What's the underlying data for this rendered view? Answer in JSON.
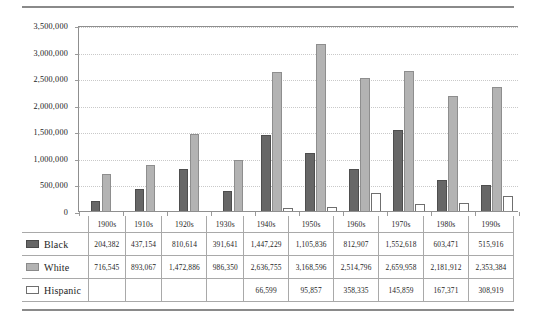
{
  "chart_data": {
    "type": "bar",
    "title": "",
    "subtitle": "",
    "xlabel": "",
    "ylabel": "",
    "ylim": [
      0,
      3500000
    ],
    "grid": true,
    "legend_position": "table-left",
    "categories": [
      "1900s",
      "1910s",
      "1920s",
      "1930s",
      "1940s",
      "1950s",
      "1960s",
      "1970s",
      "1980s",
      "1990s"
    ],
    "y_ticks": [
      0,
      500000,
      1000000,
      1500000,
      2000000,
      2500000,
      3000000,
      3500000
    ],
    "y_tick_labels": [
      "0",
      "500,000",
      "1,000,000",
      "1,500,000",
      "2,000,000",
      "2,500,000",
      "3,000,000",
      "3,500,000"
    ],
    "series": [
      {
        "name": "Black",
        "color": "#676767",
        "values": [
          204382,
          437154,
          810614,
          391641,
          1447229,
          1105836,
          812907,
          1552618,
          603471,
          515916
        ],
        "labels": [
          "204,382",
          "437,154",
          "810,614",
          "391,641",
          "1,447,229",
          "1,105,836",
          "812,907",
          "1,552,618",
          "603,471",
          "515,916"
        ]
      },
      {
        "name": "White",
        "color": "#b3b3b3",
        "values": [
          716545,
          893067,
          1472886,
          986350,
          2636755,
          3168596,
          2514796,
          2659958,
          2181912,
          2353384
        ],
        "labels": [
          "716,545",
          "893,067",
          "1,472,886",
          "986,350",
          "2,636,755",
          "3,168,596",
          "2,514,796",
          "2,659,958",
          "2,181,912",
          "2,353,384"
        ]
      },
      {
        "name": "Hispanic",
        "color": "#ffffff",
        "values": [
          null,
          null,
          null,
          null,
          66599,
          95857,
          358335,
          145859,
          167371,
          308919
        ],
        "labels": [
          "",
          "",
          "",
          "",
          "66,599",
          "95,857",
          "358,335",
          "145,859",
          "167,371",
          "308,919"
        ]
      }
    ]
  },
  "table": {
    "header_blank": "",
    "columns": [
      "1900s",
      "1910s",
      "1920s",
      "1930s",
      "1940s",
      "1950s",
      "1960s",
      "1970s",
      "1980s",
      "1990s"
    ],
    "rows": [
      {
        "label": "Black",
        "swatch": "black-swatch",
        "cells": [
          "204,382",
          "437,154",
          "810,614",
          "391,641",
          "1,447,229",
          "1,105,836",
          "812,907",
          "1,552,618",
          "603,471",
          "515,916"
        ]
      },
      {
        "label": "White",
        "swatch": "white-swatch",
        "cells": [
          "716,545",
          "893,067",
          "1,472,886",
          "986,350",
          "2,636,755",
          "3,168,596",
          "2,514,796",
          "2,659,958",
          "2,181,912",
          "2,353,384"
        ]
      },
      {
        "label": "Hispanic",
        "swatch": "hispanic-swatch",
        "cells": [
          "",
          "",
          "",
          "",
          "66,599",
          "95,857",
          "358,335",
          "145,859",
          "167,371",
          "308,919"
        ]
      }
    ]
  },
  "colors": {
    "black_series": "#676767",
    "white_series": "#b3b3b3",
    "hispanic_series": "#ffffff",
    "axis": "#8f8f8f",
    "grid": "#c9c9c9",
    "rule": "#8a8a8a"
  }
}
